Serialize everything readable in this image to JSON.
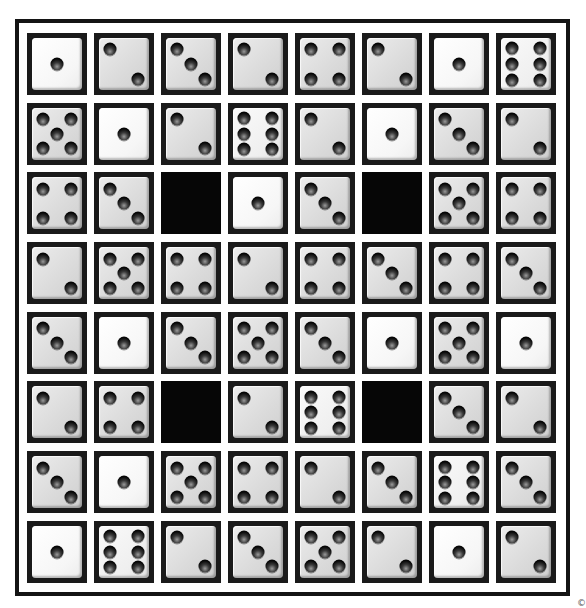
{
  "puzzle": {
    "type": "dice-grid",
    "rows": 8,
    "columns": 8,
    "colors": {
      "frame": "#141414",
      "die_border": "#1a1a1a",
      "die_face": "#dadada",
      "die_face_one": "#f6f6f6",
      "pip": "#050505",
      "blocked": "#060606"
    },
    "grid": [
      [
        1,
        2,
        3,
        2,
        4,
        2,
        1,
        6
      ],
      [
        5,
        1,
        2,
        6,
        2,
        1,
        3,
        2
      ],
      [
        4,
        3,
        0,
        1,
        3,
        0,
        5,
        4
      ],
      [
        2,
        5,
        4,
        2,
        4,
        3,
        4,
        3
      ],
      [
        3,
        1,
        3,
        5,
        3,
        1,
        5,
        1
      ],
      [
        2,
        4,
        0,
        2,
        6,
        0,
        3,
        2
      ],
      [
        3,
        1,
        5,
        4,
        2,
        3,
        6,
        3
      ],
      [
        1,
        6,
        2,
        3,
        5,
        2,
        1,
        2
      ]
    ],
    "legend": "0 = blocked black square; 1-6 = die face value"
  },
  "corner_mark": "©"
}
